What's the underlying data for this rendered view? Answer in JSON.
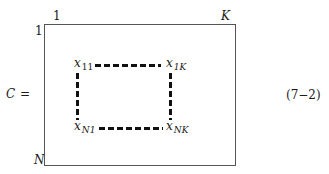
{
  "equation": {
    "lhs": "C",
    "equals": "=",
    "number": "(7−2)"
  },
  "matrix": {
    "col_start": "1",
    "col_end": "K",
    "row_start": "1",
    "row_end": "N"
  },
  "elements": {
    "top_left": {
      "var": "x",
      "sub": "11"
    },
    "top_right": {
      "var": "x",
      "sub": "1K"
    },
    "bottom_left": {
      "var": "x",
      "sub": "N1"
    },
    "bottom_right": {
      "var": "x",
      "sub": "NK"
    }
  }
}
